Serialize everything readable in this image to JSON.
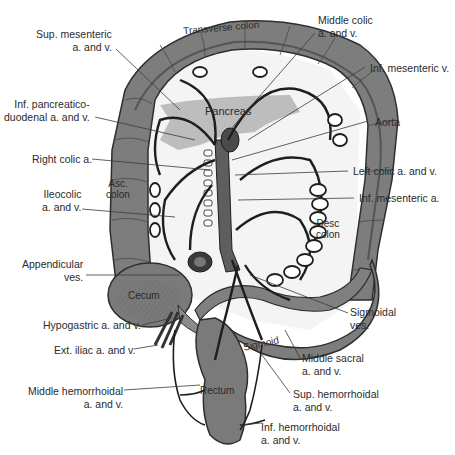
{
  "figure": {
    "colors": {
      "colon_fill": "#7d7d7d",
      "colon_dark": "#555555",
      "vessel": "#1e1e1e",
      "pancreas": "#b9b9b9",
      "mesentery": "#f2f2f2",
      "leader_line": "#3a3a3a",
      "label_text": "#2b2b2b"
    }
  },
  "structures": {
    "transverse_colon": "Transverse colon",
    "pancreas": "Pancreas",
    "asc_colon_line1": "Asc.",
    "asc_colon_line2": "colon",
    "desc_colon_line1": "Desc",
    "desc_colon_line2": "colon",
    "cecum": "Cecum",
    "sigmoid": "Sigmoid",
    "rectum": "Rectum"
  },
  "labels_left": [
    {
      "id": "sup-mesenteric",
      "line1": "Sup. mesenteric",
      "line2": "a. and v."
    },
    {
      "id": "inf-pancreaticoduodenal",
      "line1": "Inf. pancreatico-",
      "line2": "duodenal a. and v."
    },
    {
      "id": "right-colic",
      "line1": "Right colic a.",
      "line2": ""
    },
    {
      "id": "ileocolic",
      "line1": "Ileocolic",
      "line2": "a. and v."
    },
    {
      "id": "appendicular",
      "line1": "Appendicular",
      "line2": "ves."
    },
    {
      "id": "hypogastric",
      "line1": "Hypogastric a. and v.",
      "line2": ""
    },
    {
      "id": "ext-iliac",
      "line1": "Ext. iliac a. and v.",
      "line2": ""
    },
    {
      "id": "middle-hemorrhoidal",
      "line1": "Middle hemorrhoidal",
      "line2": "a. and v."
    }
  ],
  "labels_right": [
    {
      "id": "middle-colic",
      "line1": "Middle colic",
      "line2": "a. and v."
    },
    {
      "id": "inf-mesenteric-v",
      "line1": "Inf. mesenteric v.",
      "line2": ""
    },
    {
      "id": "aorta",
      "line1": "Aorta",
      "line2": ""
    },
    {
      "id": "left-colic",
      "line1": "Left colic a. and v.",
      "line2": ""
    },
    {
      "id": "inf-mesenteric-a",
      "line1": "Inf. mesenteric a.",
      "line2": ""
    },
    {
      "id": "sigmoidal",
      "line1": "Sigmoidal",
      "line2": "ves."
    },
    {
      "id": "middle-sacral",
      "line1": "Middle sacral",
      "line2": "a. and v."
    },
    {
      "id": "sup-hemorrhoidal",
      "line1": "Sup. hemorrhoidal",
      "line2": "a. and v."
    },
    {
      "id": "inf-hemorrhoidal",
      "line1": "Inf. hemorrhoidal",
      "line2": "a. and v."
    }
  ]
}
